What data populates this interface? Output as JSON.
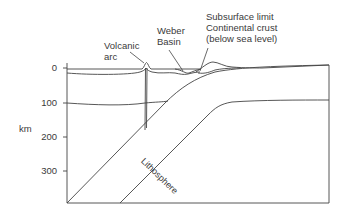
{
  "diagram": {
    "type": "subduction-zone cross-section",
    "labels": {
      "volcanic_arc_line1": "Volcanic",
      "volcanic_arc_line2": "arc",
      "weber_basin_line1": "Weber",
      "weber_basin_line2": "Basin",
      "subsurface_line1": "Subsurface limit",
      "subsurface_line2": "Continental crust",
      "subsurface_line3": "(below sea level)",
      "lithosphere": "Lithosphere"
    },
    "axis": {
      "unit_label": "km",
      "ticks": [
        "0",
        "100",
        "200",
        "300"
      ]
    },
    "colors": {
      "line": "#444444",
      "text": "#3a3a3a",
      "background": "#ffffff"
    }
  }
}
